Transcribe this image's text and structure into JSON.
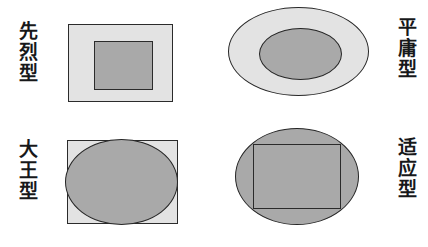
{
  "figure": {
    "background_color": "#ffffff",
    "layout": "2x2 grid of labeled shape-containment diagrams",
    "palette": {
      "light_gray_fill": "#e3e3e3",
      "dark_gray_fill": "#a9a9a9",
      "outline": "#2b2b2b",
      "text": "#17181a"
    }
  },
  "panels": [
    {
      "id": "xianlie",
      "label": "先烈型",
      "label_side": "left",
      "outer_shape": "rectangle",
      "outer_fill": "#e3e3e3",
      "inner_shape": "rectangle",
      "inner_fill": "#a9a9a9",
      "relation": "inner rectangle much smaller than outer rectangle"
    },
    {
      "id": "pingyong",
      "label": "平庸型",
      "label_side": "right",
      "outer_shape": "ellipse",
      "outer_fill": "#e3e3e3",
      "inner_shape": "ellipse",
      "inner_fill": "#a9a9a9",
      "relation": "inner ellipse smaller than outer ellipse"
    },
    {
      "id": "dawang",
      "label": "大王型",
      "label_side": "left",
      "outer_shape": "rectangle",
      "outer_fill": "#e3e3e3",
      "inner_shape": "ellipse",
      "inner_fill": "#a9a9a9",
      "relation": "ellipse inscribed in rectangle, nearly filling it"
    },
    {
      "id": "shiying",
      "label": "适应型",
      "label_side": "right",
      "outer_shape": "ellipse",
      "outer_fill": "#a9a9a9",
      "inner_shape": "rectangle-outline",
      "inner_fill": "transparent",
      "relation": "rectangle outline inscribed inside filled ellipse"
    }
  ]
}
